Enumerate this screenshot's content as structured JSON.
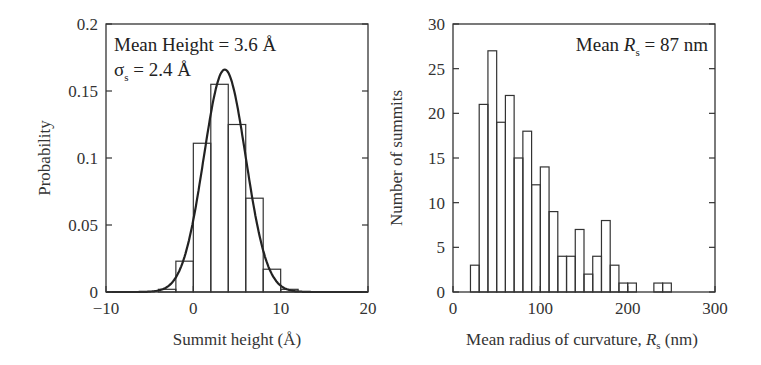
{
  "chart_data": [
    {
      "type": "bar",
      "subtype": "histogram_with_gaussian_fit",
      "xlabel": "Summit height (Å)",
      "ylabel": "Probability",
      "xlim": [
        -10,
        20
      ],
      "ylim": [
        0,
        0.2
      ],
      "xticks": [
        "−10",
        "0",
        "10",
        "20"
      ],
      "yticks": [
        "0",
        "0.05",
        "0.1",
        "0.15",
        "0.2"
      ],
      "grid": false,
      "annotations": [
        "Mean Height = 3.6 Å",
        "σs = 2.4 Å"
      ],
      "annotation_line1": "Mean Height = 3.6 Å",
      "annotation_sigma": "σ",
      "annotation_sigma_sub": "s",
      "annotation_sigma_rest": " = 2.4 Å",
      "bin_edges": [
        -4,
        -2,
        0,
        2,
        4,
        6,
        8,
        10,
        12
      ],
      "values": [
        0.002,
        0.023,
        0.111,
        0.155,
        0.125,
        0.07,
        0.017,
        0.002
      ],
      "fit": {
        "type": "gaussian",
        "mean": 3.6,
        "sigma": 2.4,
        "peak": 0.166
      }
    },
    {
      "type": "bar",
      "subtype": "histogram",
      "xlabel": "Mean radius of curvature, Rs (nm)",
      "xlabel_main": "Mean radius of curvature, ",
      "xlabel_var": "R",
      "xlabel_sub": "s",
      "xlabel_unit": " (nm)",
      "ylabel": "Number of summits",
      "xlim": [
        0,
        300
      ],
      "ylim": [
        0,
        30
      ],
      "xticks": [
        "0",
        "100",
        "200",
        "300"
      ],
      "yticks": [
        "0",
        "5",
        "10",
        "15",
        "20",
        "25",
        "30"
      ],
      "grid": false,
      "annotation": "Mean Rs = 87 nm",
      "annotation_pre": "Mean ",
      "annotation_var": "R",
      "annotation_sub": "s",
      "annotation_post": " = 87 nm",
      "bin_width": 10,
      "bins_start": [
        20,
        30,
        40,
        50,
        60,
        70,
        80,
        90,
        100,
        110,
        120,
        130,
        140,
        150,
        160,
        170,
        180,
        190,
        200,
        230,
        240
      ],
      "values": [
        3,
        21,
        27,
        19,
        22,
        15,
        18,
        12,
        14,
        9,
        4,
        4,
        7,
        2,
        4,
        8,
        3,
        1,
        1,
        1,
        1
      ]
    }
  ]
}
